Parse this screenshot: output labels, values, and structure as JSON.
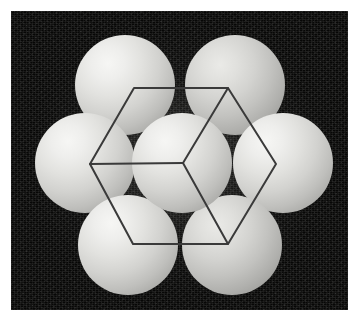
{
  "figure": {
    "title": "Hexagonal close-packed sphere model with hexagonal prism unit cell outline",
    "caption": "",
    "canvas": {
      "width": 357,
      "height": 322
    },
    "border": {
      "color": "#ffffff",
      "left": 11,
      "top": 11,
      "right": 9,
      "bottom": 12
    }
  },
  "scene": {
    "name": "crystal-packing-scene",
    "x": 11,
    "y": 11,
    "width": 337,
    "height": 299,
    "background": {
      "name": "dark-speckled-background",
      "base_color": "#070706",
      "glow_color": "#787873",
      "texture": "speckle-noise"
    }
  },
  "spheres": {
    "count": 7,
    "radius": 50,
    "arrangement": "hexagonal-close-packed-layer",
    "highlight_color": "#f6f6f4",
    "shadow_color": "#8d8d8a",
    "items": [
      {
        "id": "sphere-top-left",
        "label": "Top-left sphere",
        "cx": 125,
        "cy": 85,
        "r": 50,
        "dim": false
      },
      {
        "id": "sphere-top-right",
        "label": "Top-right sphere",
        "cx": 235,
        "cy": 85,
        "r": 50,
        "dim": true
      },
      {
        "id": "sphere-left",
        "label": "Left sphere",
        "cx": 85,
        "cy": 163,
        "r": 50,
        "dim": false
      },
      {
        "id": "sphere-right",
        "label": "Right sphere",
        "cx": 283,
        "cy": 163,
        "r": 50,
        "dim": false
      },
      {
        "id": "sphere-bottom-left",
        "label": "Bottom-left sphere",
        "cx": 128,
        "cy": 245,
        "r": 50,
        "dim": false
      },
      {
        "id": "sphere-bottom-right",
        "label": "Bottom-right sphere",
        "cx": 232,
        "cy": 245,
        "r": 50,
        "dim": true
      },
      {
        "id": "sphere-center",
        "label": "Central sphere",
        "cx": 182,
        "cy": 163,
        "r": 50,
        "dim": false
      }
    ]
  },
  "wireframe": {
    "name": "hexagonal-prism-outline",
    "stroke_color": "#3a3a3a",
    "stroke_width": 2,
    "center_vertex": {
      "x": 183,
      "y": 163
    },
    "hexagon_vertices": [
      {
        "name": "vertex-top-left",
        "x": 134,
        "y": 88
      },
      {
        "name": "vertex-top-right",
        "x": 228,
        "y": 88
      },
      {
        "name": "vertex-right",
        "x": 276,
        "y": 164
      },
      {
        "name": "vertex-bottom-right",
        "x": 228,
        "y": 244
      },
      {
        "name": "vertex-bottom-left",
        "x": 133,
        "y": 244
      },
      {
        "name": "vertex-left",
        "x": 90,
        "y": 164
      }
    ],
    "hexagon_path": "M134,88 L228,88 L276,164 L228,244 L133,244 L90,164 Z",
    "internal_edges": [
      {
        "name": "edge-center-to-left",
        "path": "M183,163 L90,164"
      },
      {
        "name": "edge-center-to-top-right",
        "path": "M183,163 L228,88"
      },
      {
        "name": "edge-center-to-bottom-right",
        "path": "M183,163 L228,244"
      }
    ]
  }
}
